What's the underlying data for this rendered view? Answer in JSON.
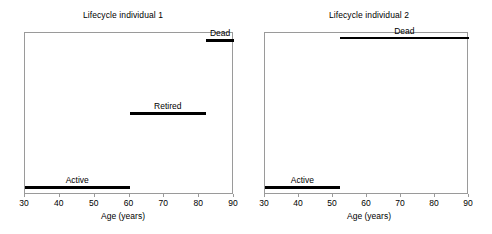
{
  "figure": {
    "background_color": "#ffffff",
    "frame_color": "#9a9a9a",
    "bar_color": "#000000"
  },
  "chart_data": {
    "type": "bar",
    "title": "",
    "xlabel": "Age (years)",
    "ylabel": "",
    "xlim": [
      30,
      90
    ],
    "ylim": [
      0,
      1
    ],
    "grid": false,
    "legend": "none",
    "orientation": "horizontal-segments",
    "xticks": [
      30,
      40,
      50,
      60,
      70,
      80,
      90
    ],
    "xticklabels": [
      "30",
      "40",
      "50",
      "60",
      "70",
      "80",
      "90"
    ],
    "panels": [
      {
        "title": "Lifecycle individual 1",
        "xlabel": "Age (years)",
        "xlim": [
          30,
          90
        ],
        "segments": [
          {
            "label": "Dead",
            "start": 82,
            "end": 90,
            "level": 0.96
          },
          {
            "label": "Retired",
            "start": 60,
            "end": 82,
            "level": 0.5
          },
          {
            "label": "Active",
            "start": 30,
            "end": 60,
            "level": 0.03
          }
        ]
      },
      {
        "title": "Lifecycle individual 2",
        "xlabel": "Age (years)",
        "xlim": [
          30,
          90
        ],
        "segments": [
          {
            "label": "Dead",
            "start": 52,
            "end": 90,
            "level": 0.975
          },
          {
            "label": "Active",
            "start": 30,
            "end": 52,
            "level": 0.03
          }
        ]
      }
    ]
  }
}
